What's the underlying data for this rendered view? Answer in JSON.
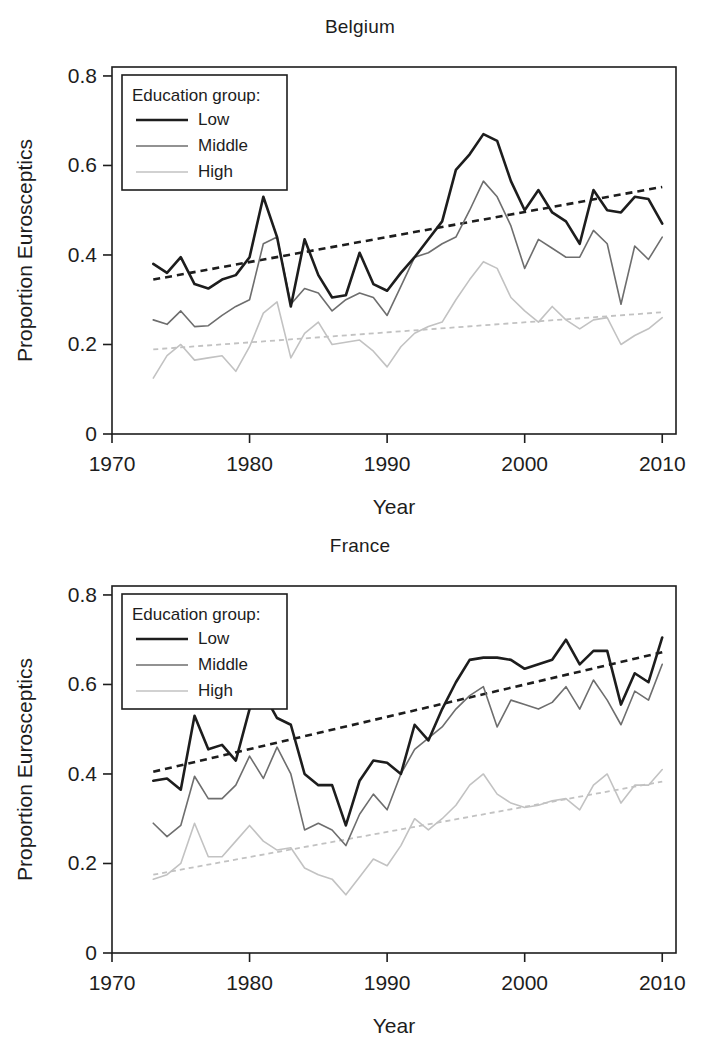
{
  "figure": {
    "axis_titles": {
      "x": "Year",
      "y": "Proportion Eurosceptics"
    },
    "legend": {
      "title": "Education group:",
      "items": [
        {
          "label": "Low",
          "color": "#1d1d1d",
          "width": 2.6,
          "dash": "none"
        },
        {
          "label": "Middle",
          "color": "#6e6e6e",
          "width": 1.6,
          "dash": "none"
        },
        {
          "label": "High",
          "color": "#c2c2c2",
          "width": 1.6,
          "dash": "none"
        }
      ]
    },
    "y_ticks": [
      "0",
      "0.2",
      "0.4",
      "0.6",
      "0.8"
    ],
    "x_ticks": [
      "1970",
      "1980",
      "1990",
      "2000",
      "2010"
    ]
  },
  "chart_data": [
    {
      "type": "line",
      "title": "Belgium",
      "xlabel": "Year",
      "ylabel": "Proportion Eurosceptics",
      "xlim": [
        1970,
        2011
      ],
      "ylim": [
        0,
        0.82
      ],
      "grid": false,
      "legend_position": "top-left",
      "x": [
        1973,
        1974,
        1975,
        1976,
        1977,
        1978,
        1979,
        1980,
        1981,
        1982,
        1983,
        1984,
        1985,
        1986,
        1987,
        1988,
        1989,
        1990,
        1991,
        1992,
        1993,
        1994,
        1995,
        1996,
        1997,
        1998,
        1999,
        2000,
        2001,
        2002,
        2003,
        2004,
        2005,
        2006,
        2007,
        2008,
        2009,
        2010
      ],
      "series": [
        {
          "name": "Low",
          "color": "#1d1d1d",
          "width": 2.6,
          "values": [
            0.38,
            0.36,
            0.395,
            0.335,
            0.325,
            0.345,
            0.355,
            0.395,
            0.53,
            0.44,
            0.285,
            0.435,
            0.355,
            0.305,
            0.31,
            0.405,
            0.335,
            0.32,
            0.36,
            0.395,
            0.435,
            0.475,
            0.59,
            0.625,
            0.67,
            0.655,
            0.565,
            0.5,
            0.545,
            0.495,
            0.475,
            0.425,
            0.545,
            0.5,
            0.495,
            0.53,
            0.525,
            0.47
          ]
        },
        {
          "name": "Middle",
          "color": "#6e6e6e",
          "width": 1.6,
          "values": [
            0.255,
            0.245,
            0.275,
            0.24,
            0.242,
            0.265,
            0.285,
            0.3,
            0.425,
            0.44,
            0.29,
            0.325,
            0.315,
            0.275,
            0.3,
            0.315,
            0.305,
            0.265,
            0.33,
            0.395,
            0.405,
            0.425,
            0.44,
            0.5,
            0.565,
            0.53,
            0.465,
            0.37,
            0.435,
            0.415,
            0.395,
            0.395,
            0.455,
            0.425,
            0.29,
            0.42,
            0.39,
            0.44
          ]
        },
        {
          "name": "High",
          "color": "#c2c2c2",
          "width": 1.6,
          "values": [
            0.125,
            0.175,
            0.2,
            0.165,
            0.17,
            0.175,
            0.14,
            0.195,
            0.27,
            0.295,
            0.17,
            0.225,
            0.25,
            0.2,
            0.205,
            0.21,
            0.185,
            0.15,
            0.195,
            0.225,
            0.24,
            0.25,
            0.3,
            0.345,
            0.385,
            0.37,
            0.305,
            0.275,
            0.25,
            0.285,
            0.255,
            0.235,
            0.255,
            0.26,
            0.2,
            0.22,
            0.235,
            0.26
          ]
        }
      ],
      "trendlines": [
        {
          "name": "Low trend",
          "color": "#1d1d1d",
          "width": 2.6,
          "dash": "7,5",
          "x": [
            1973,
            2010
          ],
          "y": [
            0.345,
            0.552
          ]
        },
        {
          "name": "High trend",
          "color": "#c2c2c2",
          "width": 1.8,
          "dash": "5,4",
          "x": [
            1973,
            2010
          ],
          "y": [
            0.189,
            0.272
          ]
        }
      ]
    },
    {
      "type": "line",
      "title": "France",
      "xlabel": "Year",
      "ylabel": "Proportion Eurosceptics",
      "xlim": [
        1970,
        2011
      ],
      "ylim": [
        0,
        0.82
      ],
      "grid": false,
      "legend_position": "top-left",
      "x": [
        1973,
        1974,
        1975,
        1976,
        1977,
        1978,
        1979,
        1980,
        1981,
        1982,
        1983,
        1984,
        1985,
        1986,
        1987,
        1988,
        1989,
        1990,
        1991,
        1992,
        1993,
        1994,
        1995,
        1996,
        1997,
        1998,
        1999,
        2000,
        2001,
        2002,
        2003,
        2004,
        2005,
        2006,
        2007,
        2008,
        2009,
        2010
      ],
      "series": [
        {
          "name": "Low",
          "color": "#1d1d1d",
          "width": 2.6,
          "values": [
            0.385,
            0.39,
            0.365,
            0.53,
            0.455,
            0.465,
            0.43,
            0.545,
            0.58,
            0.525,
            0.51,
            0.4,
            0.375,
            0.375,
            0.285,
            0.385,
            0.43,
            0.425,
            0.4,
            0.51,
            0.475,
            0.545,
            0.605,
            0.655,
            0.66,
            0.66,
            0.655,
            0.635,
            0.645,
            0.655,
            0.7,
            0.645,
            0.675,
            0.675,
            0.555,
            0.625,
            0.605,
            0.705
          ]
        },
        {
          "name": "Middle",
          "color": "#6e6e6e",
          "width": 1.6,
          "values": [
            0.29,
            0.26,
            0.285,
            0.395,
            0.345,
            0.345,
            0.375,
            0.44,
            0.39,
            0.46,
            0.4,
            0.275,
            0.29,
            0.275,
            0.24,
            0.31,
            0.355,
            0.32,
            0.4,
            0.455,
            0.48,
            0.505,
            0.545,
            0.575,
            0.595,
            0.505,
            0.565,
            0.555,
            0.545,
            0.56,
            0.595,
            0.545,
            0.61,
            0.565,
            0.51,
            0.585,
            0.565,
            0.645
          ]
        },
        {
          "name": "High",
          "color": "#c2c2c2",
          "width": 1.6,
          "values": [
            0.165,
            0.175,
            0.2,
            0.29,
            0.215,
            0.215,
            0.25,
            0.285,
            0.25,
            0.23,
            0.235,
            0.19,
            0.175,
            0.165,
            0.13,
            0.17,
            0.21,
            0.195,
            0.24,
            0.3,
            0.275,
            0.3,
            0.33,
            0.375,
            0.4,
            0.355,
            0.335,
            0.325,
            0.33,
            0.34,
            0.345,
            0.32,
            0.375,
            0.4,
            0.335,
            0.375,
            0.375,
            0.41
          ]
        }
      ],
      "trendlines": [
        {
          "name": "Low trend",
          "color": "#1d1d1d",
          "width": 2.6,
          "dash": "7,5",
          "x": [
            1973,
            2010
          ],
          "y": [
            0.405,
            0.672
          ]
        },
        {
          "name": "High trend",
          "color": "#c2c2c2",
          "width": 1.8,
          "dash": "5,4",
          "x": [
            1973,
            2010
          ],
          "y": [
            0.175,
            0.383
          ]
        }
      ]
    }
  ]
}
